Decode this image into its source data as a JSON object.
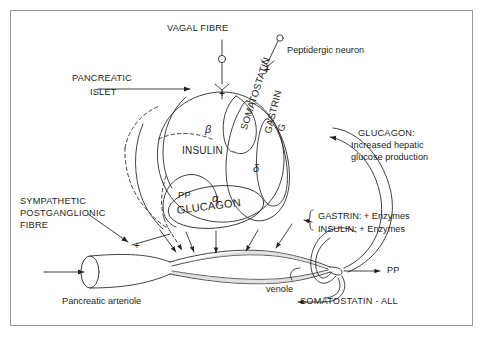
{
  "figure": {
    "background": "#ffffff",
    "border_color": "#9a9a9a",
    "ink": "#231f20"
  },
  "labels": {
    "vagal_fibre": "VAGAL FIBRE",
    "peptidergic_neuron": "Peptidergic neuron",
    "pancreatic": "PANCREATIC",
    "islet": "ISLET",
    "sympathetic_1": "SYMPATHETIC",
    "sympathetic_2": "POSTGANGLIONIC",
    "sympathetic_3": "FIBRE",
    "pancreatic_arteriole": "Pancreatic arteriole",
    "venole": "venole"
  },
  "islet_cells": {
    "beta_symbol": "β",
    "beta_hormone": "INSULIN",
    "delta_symbol": "δ",
    "delta_hormone": "SOMATOSTATIN",
    "g_symbol": "G",
    "g_hormone": "GASTRIN",
    "alpha_symbol": "α",
    "alpha_hormone": "GLUCAGON",
    "pp_symbol": "PP"
  },
  "outputs": {
    "glucagon_title": "GLUCAGON:",
    "glucagon_line2": "Increased hepatic",
    "glucagon_line3": "glucose production",
    "gastrin_enzymes": "GASTRIN: + Enzymes",
    "insulin_enzymes": "INSULIN: + Enzymes",
    "pp": "PP",
    "somatostatin_all": "SOMATOSTATIN - ALL"
  },
  "signs": {
    "vagal_plus": "+",
    "peptidergic_plus": "+",
    "sympathetic_plus": "+"
  }
}
